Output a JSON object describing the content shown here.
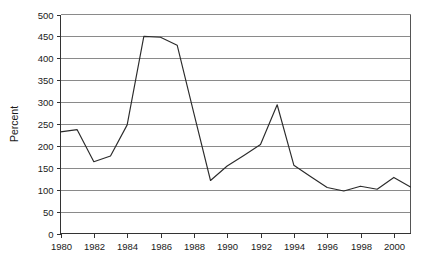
{
  "chart_data": {
    "type": "line",
    "title": "",
    "subtitle": "",
    "xlabel": "",
    "ylabel": "Percent",
    "xlim": [
      1980,
      2001
    ],
    "ylim": [
      0,
      500
    ],
    "y_ticks": [
      0,
      50,
      100,
      150,
      200,
      250,
      300,
      350,
      400,
      450,
      500
    ],
    "x_ticks": [
      1980,
      1982,
      1984,
      1986,
      1988,
      1990,
      1992,
      1994,
      1996,
      1998,
      2000
    ],
    "x_tick_labels": [
      "1980",
      "1982",
      "1984",
      "1986",
      "1988",
      "1990",
      "1992",
      "1994",
      "1996",
      "1998",
      "2000"
    ],
    "y_tick_labels": [
      "0",
      "50",
      "100",
      "150",
      "200",
      "250",
      "300",
      "350",
      "400",
      "450",
      "500"
    ],
    "grid": true,
    "grid_axis": "y",
    "legend": false,
    "legend_position": "none",
    "line_color": "#2b2b2b",
    "grid_color": "#8a8a8a",
    "frame_color": "#555555",
    "background_color": "#ffffff",
    "x": [
      1980,
      1981,
      1982,
      1983,
      1984,
      1985,
      1986,
      1987,
      1988,
      1989,
      1990,
      1991,
      1992,
      1993,
      1994,
      1995,
      1996,
      1997,
      1998,
      1999,
      2000,
      2001
    ],
    "values": [
      232,
      237,
      164,
      177,
      248,
      450,
      448,
      430,
      275,
      121,
      154,
      178,
      203,
      294,
      156,
      130,
      105,
      97,
      108,
      101,
      128,
      106
    ],
    "series": [
      {
        "name": "Percent",
        "values": [
          232,
          237,
          164,
          177,
          248,
          450,
          448,
          430,
          275,
          121,
          154,
          178,
          203,
          294,
          156,
          130,
          105,
          97,
          108,
          101,
          128,
          106
        ]
      }
    ]
  }
}
